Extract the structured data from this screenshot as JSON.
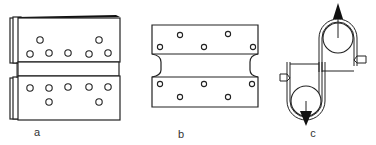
{
  "figure": {
    "panels": [
      {
        "id": "a",
        "label": "a",
        "description": "two stacked plates with offset hole pattern, shown with edge thickness"
      },
      {
        "id": "b",
        "label": "b",
        "description": "single waisted plate with hole pattern top and bottom"
      },
      {
        "id": "c",
        "label": "c",
        "description": "belt wrapped around two opposed pulleys with tension arrows"
      }
    ],
    "colors": {
      "line": "#222222",
      "background": "#ffffff",
      "label": "#333333"
    }
  }
}
